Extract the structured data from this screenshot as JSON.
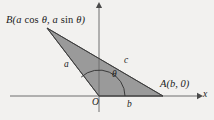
{
  "figure": {
    "background_color": "#f2f1ef",
    "fill_color": "#9a9a9a",
    "stroke_color": "#4a4a4a",
    "axis_color": "#6e6e6e",
    "text_color": "#1b1b1b"
  },
  "axes": {
    "x_axis_label": "x",
    "origin_label": "O",
    "x_axis": {
      "x1": 10,
      "y1": 96,
      "x2": 200,
      "y2": 96
    },
    "y_axis": {
      "x1": 99,
      "y1": 112,
      "x2": 99,
      "y2": 4
    }
  },
  "vertices": {
    "origin": {
      "name": "O",
      "x": 99,
      "y": 96
    },
    "A": {
      "label": "A(b, 0)",
      "x": 163,
      "y": 96
    },
    "B": {
      "label": "B(a cos θ, a sin θ)",
      "x": 47,
      "y": 28
    }
  },
  "sides": {
    "a": {
      "label": "a",
      "from": "O",
      "to": "B"
    },
    "b": {
      "label": "b",
      "from": "O",
      "to": "A"
    },
    "c": {
      "label": "c",
      "from": "A",
      "to": "B"
    }
  },
  "angle": {
    "label": "θ",
    "at": "O",
    "from_ray": "positive x-axis",
    "to_ray": "OB",
    "arc_radius": 26
  },
  "label_B_parts": {
    "open": "B(",
    "a1": "a",
    "cos": "cos",
    "theta1": "θ",
    "comma": ",",
    "a2": "a",
    "sin": "sin",
    "theta2": "θ",
    "close": ")"
  }
}
